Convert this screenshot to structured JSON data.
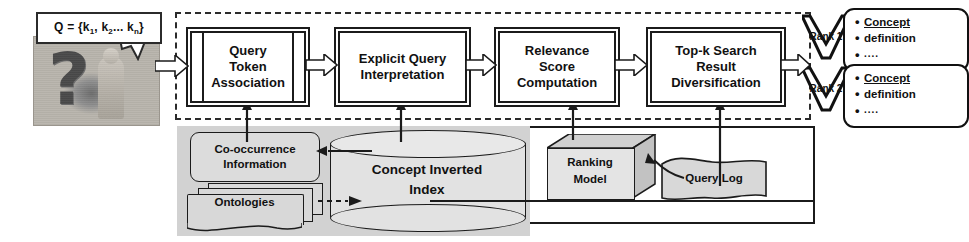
{
  "diagram": {
    "query_input": {
      "bubble_prefix": "Q = {k",
      "bubble_text": "Q = {k1, k2... kn}",
      "sub1": "1",
      "mid": ", k",
      "sub2": "2",
      "tail": "... k",
      "sub3": "n",
      "close": "}",
      "photo_name": "question-mark-person-photo"
    },
    "pipeline": {
      "stages": [
        {
          "id": "query-token-association",
          "label": "Query\nToken\nAssociation",
          "lines": [
            "Query",
            "Token",
            "Association"
          ]
        },
        {
          "id": "explicit-query-interpretation",
          "label": "Explicit Query Interpretation",
          "lines": [
            "Explicit Query",
            "Interpretation"
          ]
        },
        {
          "id": "relevance-score-computation",
          "label": "Relevance Score Computation",
          "lines": [
            "Relevance",
            "Score",
            "Computation"
          ]
        },
        {
          "id": "top-k-search-result-diversification",
          "label": "Top-k Search Result Diversification",
          "lines": [
            "Top-k Search",
            "Result",
            "Diversification"
          ]
        }
      ]
    },
    "data_layer": {
      "cooccurrence": {
        "lines": [
          "Co-occurrence",
          "Information"
        ]
      },
      "ontologies": {
        "label": "Ontologies"
      },
      "concept_index": {
        "lines": [
          "Concept Inverted",
          "Index"
        ]
      },
      "ranking_model": {
        "lines": [
          "Ranking",
          "Model"
        ]
      },
      "query_log": {
        "label": "Query Log"
      }
    },
    "results": {
      "ranks": [
        {
          "label": "Rank 1"
        },
        {
          "label": "Rank 2"
        }
      ],
      "cards": [
        {
          "items": [
            "Concept",
            "definition",
            "...."
          ]
        },
        {
          "items": [
            "Concept",
            "definition",
            "...."
          ]
        }
      ]
    },
    "colors": {
      "stroke": "#1b1b1b",
      "panel_gray": "#d2d2d2",
      "shape_fill": "#e2e2e2",
      "background": "#ffffff"
    }
  }
}
